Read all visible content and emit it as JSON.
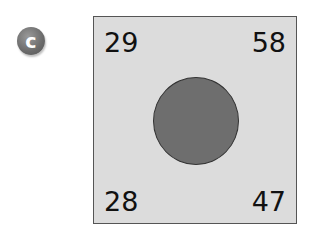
{
  "badge": {
    "label": "c"
  },
  "square": {
    "top_left": "29",
    "top_right": "58",
    "bottom_left": "28",
    "bottom_right": "47"
  },
  "colors": {
    "square_fill": "#dcdcdc",
    "circle_fill": "#6e6e6e",
    "badge_fill": "#777777"
  }
}
